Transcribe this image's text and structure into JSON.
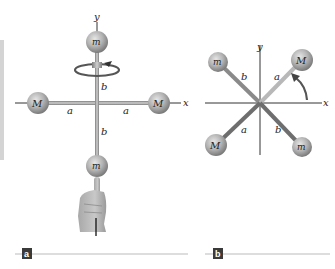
{
  "figure_a": {
    "axis_labels": {
      "y": "y",
      "x": "x"
    },
    "masses": {
      "top": "m",
      "bottom": "m",
      "left": "M",
      "right": "M"
    },
    "distances": {
      "upper": "b",
      "lower": "b",
      "left": "a",
      "right": "a"
    },
    "panel_tag": "a"
  },
  "figure_b": {
    "axis_labels": {
      "y": "y",
      "x": "x"
    },
    "masses": {
      "top_left": "m",
      "top_right": "M",
      "bottom_left": "M",
      "bottom_right": "m"
    },
    "distances": {
      "top_left": "b",
      "top_right": "a",
      "bottom_left": "a",
      "bottom_right": "b"
    },
    "panel_tag": "b"
  },
  "colors": {
    "ball": "#b0b0b0",
    "rod": "#9a9a9a",
    "axis": "#333333",
    "tag_bg": "#3a3a3a",
    "rule": "#bbbbbb"
  }
}
